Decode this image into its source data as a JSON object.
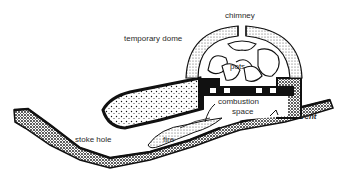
{
  "diagram": {
    "labels": {
      "chimney": "chimney",
      "temporary_dome": "temporary dome",
      "pots": "pots",
      "combustion_space_line1": "combustion",
      "combustion_space_line2": "space",
      "vent": "vent",
      "stoke_hole": "stoke hole",
      "fire": "fire"
    },
    "colors": {
      "ink": "#1a1a1a",
      "background": "#ffffff",
      "stipple_light": "#bdbdbd"
    }
  }
}
